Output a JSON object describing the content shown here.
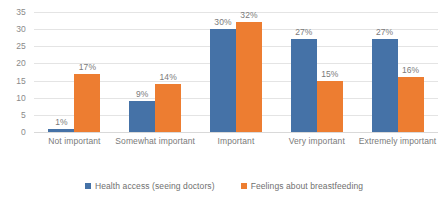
{
  "chart_data": {
    "type": "bar",
    "title": "",
    "subtitle": "",
    "xlabel": "",
    "ylabel": "",
    "ylim": [
      0,
      35
    ],
    "ytick_interval": 5,
    "yticks": [
      0,
      5,
      10,
      15,
      20,
      25,
      30,
      35
    ],
    "grid": true,
    "legend_position": "bottom",
    "categories": [
      "Not important",
      "Somewhat important",
      "Important",
      "Very important",
      "Extremely important"
    ],
    "series": [
      {
        "name": "Health access (seeing doctors)",
        "color": "#4572a7",
        "values": [
          1,
          9,
          30,
          27,
          27
        ],
        "labels": [
          "1%",
          "9%",
          "30%",
          "27%",
          "27%"
        ]
      },
      {
        "name": "Feelings about breastfeeding",
        "color": "#ed7d31",
        "values": [
          17,
          14,
          32,
          15,
          16
        ],
        "labels": [
          "17%",
          "14%",
          "32%",
          "15%",
          "16%"
        ]
      }
    ]
  }
}
